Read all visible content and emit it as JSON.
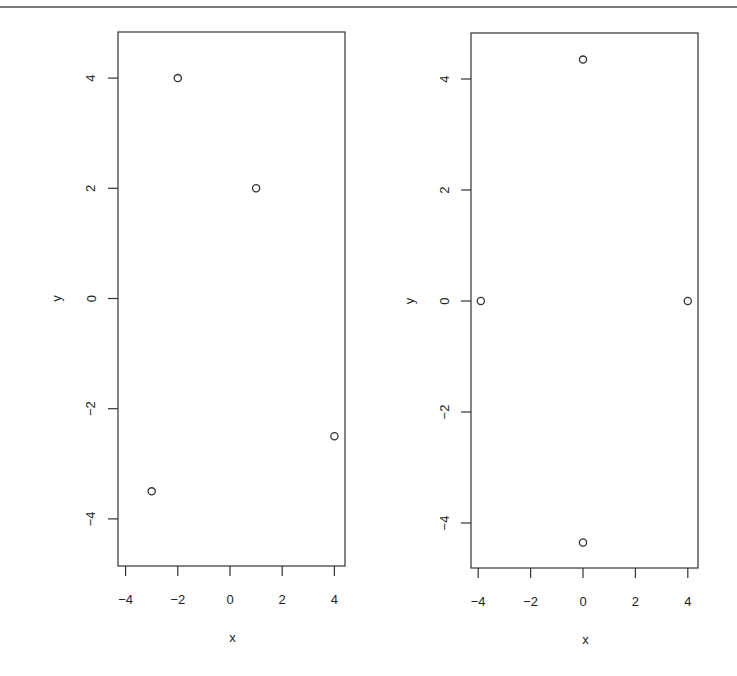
{
  "chart_data": [
    {
      "type": "scatter",
      "title": "",
      "xlabel": "x",
      "ylabel": "y",
      "xlim": [
        -4.3,
        4.4
      ],
      "ylim": [
        -5.0,
        4.9
      ],
      "xticks": [
        -4,
        -2,
        0,
        2,
        4
      ],
      "yticks": [
        -4,
        -2,
        0,
        2,
        4
      ],
      "xtick_labels": [
        "−4",
        "−2",
        "0",
        "2",
        "4"
      ],
      "ytick_labels": [
        "−4",
        "−2",
        "0",
        "2",
        "4"
      ],
      "grid": false,
      "legend": null,
      "marker": "open-circle",
      "points": [
        {
          "x": -2,
          "y": 4
        },
        {
          "x": 1,
          "y": 2
        },
        {
          "x": 4,
          "y": -2.5
        },
        {
          "x": -3,
          "y": -3.5
        }
      ]
    },
    {
      "type": "scatter",
      "title": "",
      "xlabel": "x",
      "ylabel": "y",
      "xlim": [
        -4.3,
        4.4
      ],
      "ylim": [
        -5.0,
        4.9
      ],
      "xticks": [
        -4,
        -2,
        0,
        2,
        4
      ],
      "yticks": [
        -4,
        -2,
        0,
        2,
        4
      ],
      "xtick_labels": [
        "−4",
        "−2",
        "0",
        "2",
        "4"
      ],
      "ytick_labels": [
        "−4",
        "−2",
        "0",
        "2",
        "4"
      ],
      "grid": false,
      "legend": null,
      "marker": "open-circle",
      "points": [
        {
          "x": 0,
          "y": 4.35
        },
        {
          "x": -3.9,
          "y": 0
        },
        {
          "x": 4,
          "y": 0
        },
        {
          "x": 0,
          "y": -4.35
        }
      ]
    }
  ],
  "panels": [
    {
      "box": {
        "left": 118,
        "top": 32,
        "right": 345,
        "bottom": 566
      },
      "x_origin_px": 230,
      "x_px_per_unit": 26.1,
      "y_origin_px": 298.5,
      "y_px_per_unit": 55.1
    },
    {
      "box": {
        "left": 471,
        "top": 33,
        "right": 698,
        "bottom": 568
      },
      "x_origin_px": 583,
      "x_px_per_unit": 26.2,
      "y_origin_px": 301,
      "y_px_per_unit": 55.5
    }
  ],
  "style": {
    "axis_color": "#333333",
    "marker_color": "#333333",
    "top_rule_color": "#7a7a7a"
  }
}
